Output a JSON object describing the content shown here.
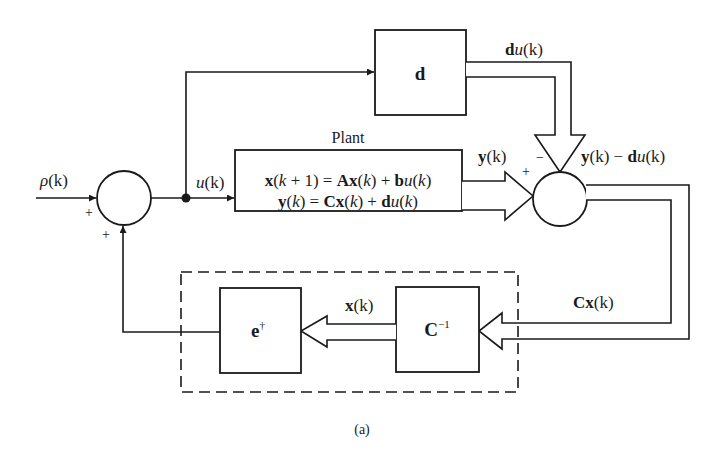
{
  "figure": {
    "caption": "(a)",
    "colors": {
      "ink": "#1a1a1a",
      "background": "#ffffff"
    }
  },
  "signals": {
    "reference": {
      "sym": "ρ",
      "arg": "(k)"
    },
    "control": {
      "sym": "u",
      "arg": "(k)"
    },
    "feedthrough": {
      "bold": "d",
      "sym": "u",
      "arg": "(k)"
    },
    "plant_output": {
      "bold": "y",
      "arg": "(k)"
    },
    "difference": {
      "bold1": "y",
      "arg1": "(k)",
      "op": " − ",
      "bold2": "d",
      "sym2": "u",
      "arg2": "(k)"
    },
    "measured_state": {
      "bold": "Cx",
      "arg": "(k)"
    },
    "state": {
      "bold": "x",
      "arg": "(k)"
    }
  },
  "summing_junctions": {
    "input": {
      "signs": [
        "+",
        "+"
      ]
    },
    "output": {
      "signs": [
        "+",
        "−"
      ]
    }
  },
  "blocks": {
    "d_block": {
      "label": "d"
    },
    "plant": {
      "title": "Plant",
      "eq1": {
        "x": "x",
        "p1": "(",
        "k": "k",
        "p2": " + 1) = ",
        "A": "Ax",
        "p3": "(",
        "k2": "k",
        "p4": ") + ",
        "b": "b",
        "u": "u",
        "p5": "(",
        "k3": "k",
        "p6": ")"
      },
      "eq2": {
        "y": "y",
        "p1": "(",
        "k": "k",
        "p2": ") = ",
        "C": "Cx",
        "p3": "(",
        "k2": "k",
        "p4": ") + ",
        "d": "d",
        "u": "u",
        "p5": "(",
        "k3": "k",
        "p6": ")"
      }
    },
    "c_inverse": {
      "label": "C",
      "sup": "−1"
    },
    "e_dagger": {
      "label": "e",
      "sup": "†"
    }
  }
}
